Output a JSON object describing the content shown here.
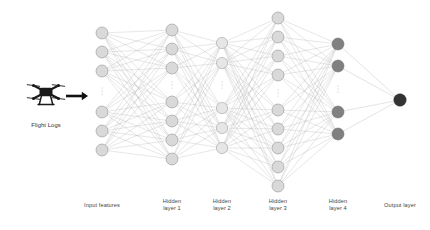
{
  "canvas": {
    "width": 430,
    "height": 230,
    "background": "#ffffff"
  },
  "palette": {
    "edge": "#b4b4b4",
    "node_light_fill": "#d9d9d9",
    "node_light_stroke": "#8d8d8d",
    "node_pale_fill": "#e6e6e6",
    "node_pale_stroke": "#9a9a9a",
    "node_dark_fill": "#808080",
    "node_dark_stroke": "#6d6d6d",
    "node_output_fill": "#333333",
    "node_output_stroke": "#2b2b2b",
    "ellipsis": "#b0b0b0",
    "arrow": "#111111",
    "drone": "#1a1a1a",
    "text": "#3f3f3f"
  },
  "source": {
    "label": "Flight Logs",
    "icon": "drone-icon",
    "icon_x": 46,
    "icon_y": 92,
    "label_x": 46,
    "label_y": 122
  },
  "arrow": {
    "name": "flow-arrow-icon",
    "x1": 66,
    "x2": 88,
    "y": 96
  },
  "output_node": {
    "x": 400,
    "y": 100,
    "r": 6.2,
    "style": "output"
  },
  "layers": [
    {
      "id": "input",
      "label": "Input features",
      "label_lines": "Input features",
      "x": 102,
      "r": 6.0,
      "style": "light",
      "label_x": 102,
      "label_y": 202,
      "nodes_top": [
        33,
        52,
        71
      ],
      "nodes_bottom": [
        112,
        131,
        150
      ],
      "ellipsis_y": 91
    },
    {
      "id": "hidden1",
      "label": "Hidden layer 1",
      "label_lines": "Hidden\nlayer 1",
      "x": 172,
      "r": 6.0,
      "style": "light",
      "label_x": 172,
      "label_y": 198,
      "nodes_top": [
        30,
        49,
        68
      ],
      "nodes_bottom": [
        102,
        121,
        140,
        159
      ],
      "ellipsis_y": 85
    },
    {
      "id": "hidden2",
      "label": "Hidden layer 2",
      "label_lines": "Hidden\nlayer 2",
      "x": 222,
      "r": 5.6,
      "style": "pale",
      "label_x": 222,
      "label_y": 198,
      "nodes_top": [
        43,
        63
      ],
      "nodes_bottom": [
        108,
        128,
        148
      ],
      "ellipsis_y": 85
    },
    {
      "id": "hidden3",
      "label": "Hidden layer 3",
      "label_lines": "Hidden\nlayer 3",
      "x": 278,
      "r": 6.0,
      "style": "light",
      "label_x": 278,
      "label_y": 198,
      "nodes_top": [
        18,
        37,
        56,
        75
      ],
      "nodes_bottom": [
        110,
        129,
        148,
        167,
        186
      ],
      "ellipsis_y": 93
    },
    {
      "id": "hidden4",
      "label": "Hidden layer 4",
      "label_lines": "Hidden\nlayer 4",
      "x": 338,
      "r": 6.0,
      "style": "dark",
      "label_x": 338,
      "label_y": 198,
      "nodes_top": [
        44,
        66
      ],
      "nodes_bottom": [
        112,
        134
      ],
      "ellipsis_y": 89
    }
  ],
  "output_layer_caption": {
    "label": "Output layer",
    "label_lines": "Output layer",
    "label_x": 400,
    "label_y": 202
  }
}
